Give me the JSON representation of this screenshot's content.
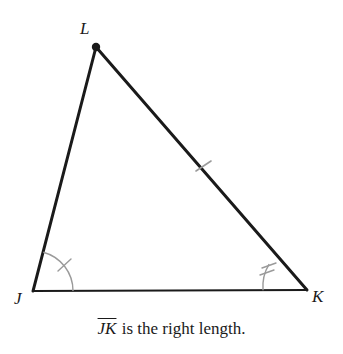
{
  "figure": {
    "type": "triangle-geometry-diagram",
    "background_color": "#ffffff",
    "stroke_color": "#1a1a1a",
    "mark_color": "#8a8a8a",
    "vertices": {
      "L": {
        "label": "L",
        "x": 96,
        "y": 47
      },
      "J": {
        "label": "J",
        "x": 33,
        "y": 291
      },
      "K": {
        "label": "K",
        "x": 307,
        "y": 290
      }
    },
    "sides": [
      {
        "name": "JL",
        "from": "J",
        "to": "L",
        "stroke_width": 3,
        "tick_marks": 0
      },
      {
        "name": "LK",
        "from": "L",
        "to": "K",
        "stroke_width": 3,
        "tick_marks": 1
      },
      {
        "name": "JK",
        "from": "J",
        "to": "K",
        "stroke_width": 2,
        "tick_marks": 0
      }
    ],
    "angle_marks": [
      {
        "at_vertex": "J",
        "arcs": 1,
        "tick_marks": 1,
        "radius": 40
      },
      {
        "at_vertex": "K",
        "arcs": 1,
        "tick_marks": 2,
        "radius": 44
      }
    ],
    "vertex_dot": {
      "at_vertex": "L",
      "radius": 4
    }
  },
  "caption": {
    "segment": "JK",
    "rest": " is the right length."
  }
}
